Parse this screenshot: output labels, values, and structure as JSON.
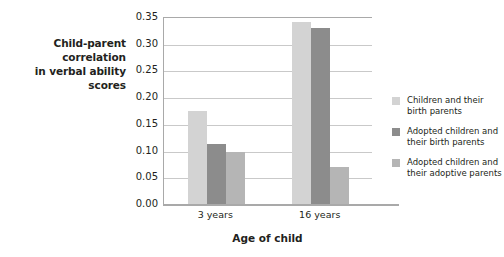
{
  "chart_data": {
    "type": "bar",
    "title": "",
    "subtitle": "",
    "xlabel": "Age of child",
    "ylabel": "Child-parent correlation in verbal ability scores",
    "ylabel_line1": "Child-parent correlation",
    "ylabel_line2": "in verbal ability scores",
    "categories": [
      "3 years",
      "16 years"
    ],
    "ylim": [
      0.0,
      0.35
    ],
    "ytick_labels": [
      "0.35",
      "0.30",
      "0.25",
      "0.20",
      "0.15",
      "0.10",
      "0.05",
      "0.00"
    ],
    "ytick_values": [
      0.35,
      0.3,
      0.25,
      0.2,
      0.15,
      0.1,
      0.05,
      0.0
    ],
    "grid": true,
    "grid_axis": "y",
    "legend_position": "right",
    "series": [
      {
        "name": "Children and their birth parents",
        "name_line1": "Children and their",
        "name_line2": "birth parents",
        "color": "#d3d3d3",
        "values": [
          0.175,
          0.34
        ]
      },
      {
        "name": "Adopted children and their birth parents",
        "name_line1": "Adopted children and",
        "name_line2": "their birth parents",
        "color": "#8c8c8c",
        "values": [
          0.113,
          0.33
        ]
      },
      {
        "name": "Adopted children and their adoptive parents",
        "name_line1": "Adopted children and",
        "name_line2": "their adoptive parents",
        "color": "#b5b5b5",
        "values": [
          0.097,
          0.07
        ]
      }
    ],
    "colors": {
      "axis": "#a9a9a9",
      "grid": "#c9c9c9",
      "text": "#231f20",
      "background": "#ffffff"
    }
  }
}
